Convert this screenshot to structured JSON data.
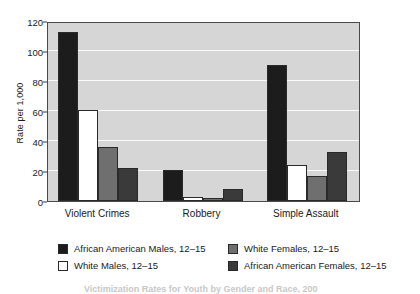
{
  "chart_data": {
    "type": "bar",
    "title": "",
    "xlabel": "",
    "ylabel": "Rate per 1,000",
    "ylim": [
      0,
      120
    ],
    "yticks": [
      0,
      20,
      40,
      60,
      80,
      100,
      120
    ],
    "grid": true,
    "legend_position": "bottom",
    "categories": [
      "Violent Crimes",
      "Robbery",
      "Simple Assault"
    ],
    "series": [
      {
        "name": "African American Males, 12–15",
        "color": "#1c1c1c",
        "values": [
          113,
          21,
          91
        ]
      },
      {
        "name": "White Males, 12–15",
        "color": "#ffffff",
        "values": [
          61,
          3,
          24
        ]
      },
      {
        "name": "White Females, 12–15",
        "color": "#6f6f6f",
        "values": [
          36,
          2,
          17
        ]
      },
      {
        "name": "African American Females, 12–15",
        "color": "#3a3a3a",
        "values": [
          22,
          8,
          33
        ]
      }
    ]
  },
  "caption": {
    "text": "Victimization Rates for Youth by Gender and Race, 200"
  },
  "colors": {
    "plot_background": "#d6d6d6",
    "gridline": "#fbfbfb",
    "axis": "#4a4a4a",
    "text": "#1a1a1a"
  }
}
